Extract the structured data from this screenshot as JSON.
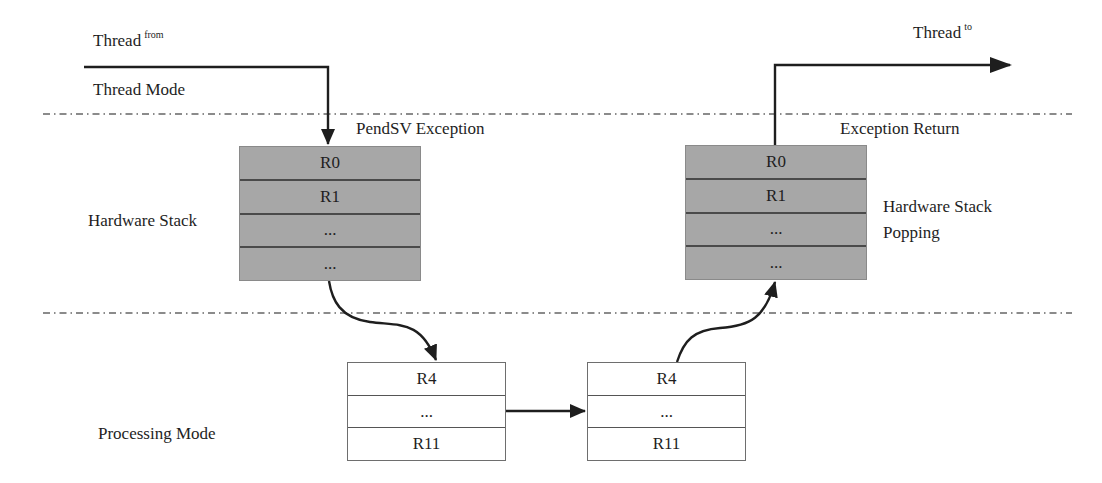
{
  "diagram": {
    "colors": {
      "stack_fill": "#a7a7a7",
      "line": "#1e1e1e",
      "divider": "#555555"
    },
    "labels": {
      "thread_from": {
        "main": "Thread",
        "sup": "from"
      },
      "thread_to": {
        "main": "Thread",
        "sup": "to"
      },
      "thread_mode": "Thread Mode",
      "pendsv_exception": "PendSV Exception",
      "exception_return": "Exception Return",
      "hardware_stack": "Hardware Stack",
      "hardware_stack_popping_line1": "Hardware Stack",
      "hardware_stack_popping_line2": "Popping",
      "processing_mode": "Processing Mode"
    },
    "hardware_stack_push": {
      "cells": [
        "R0",
        "R1",
        "...",
        "..."
      ]
    },
    "hardware_stack_pop": {
      "cells": [
        "R0",
        "R1",
        "...",
        "..."
      ]
    },
    "software_stack_save": {
      "cells": [
        "R4",
        "...",
        "R11"
      ]
    },
    "software_stack_restore": {
      "cells": [
        "R4",
        "...",
        "R11"
      ]
    },
    "arrows": [
      {
        "from": "thread_from",
        "to": "hardware_stack_push"
      },
      {
        "from": "hardware_stack_push",
        "to": "software_stack_save"
      },
      {
        "from": "software_stack_save",
        "to": "software_stack_restore"
      },
      {
        "from": "software_stack_restore",
        "to": "hardware_stack_pop"
      },
      {
        "from": "hardware_stack_pop",
        "to": "thread_to"
      }
    ],
    "regions": [
      "Thread Mode",
      "Processing Mode"
    ]
  }
}
